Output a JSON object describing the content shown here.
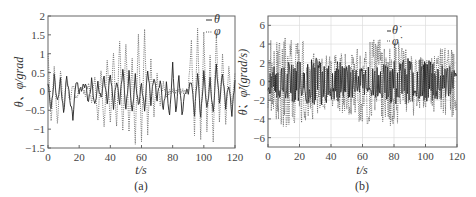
{
  "chart_data": [
    {
      "id": "a",
      "type": "line",
      "caption": "(a)",
      "xlabel": "t/s",
      "ylabel": "θ、φ/grad",
      "xlim": [
        0,
        120
      ],
      "ylim": [
        -1.5,
        2
      ],
      "xticks": [
        "0",
        "20",
        "40",
        "60",
        "80",
        "100",
        "120"
      ],
      "yticks": [
        "-1.5",
        "-1",
        "-0.5",
        "0",
        "0.5",
        "1",
        "1.5",
        "2"
      ],
      "grid": false,
      "legend": {
        "position": "upper right",
        "entries": [
          "θ",
          "φ"
        ]
      },
      "series": [
        {
          "name": "θ",
          "style": "solid",
          "amplitude_range": [
            -0.8,
            0.8
          ],
          "x": [
            0,
            2,
            4,
            6,
            8,
            10,
            12,
            14,
            16,
            18,
            20,
            22,
            24,
            26,
            28,
            30,
            32,
            34,
            36,
            38,
            40,
            42,
            44,
            46,
            48,
            50,
            52,
            54,
            56,
            58,
            60,
            62,
            64,
            66,
            68,
            70,
            72,
            74,
            76,
            78,
            80,
            82,
            84,
            86,
            88,
            90,
            92,
            94,
            96,
            98,
            100,
            102,
            104,
            106,
            108,
            110,
            112,
            114,
            116,
            118,
            120
          ],
          "y": [
            0.2,
            -0.5,
            0.4,
            -0.3,
            0.3,
            -0.6,
            0.4,
            -0.2,
            -0.7,
            0.3,
            0.0,
            0.1,
            0.2,
            -0.3,
            0.3,
            -0.4,
            0.2,
            -0.2,
            0.4,
            -0.3,
            0.5,
            -0.4,
            0.3,
            -0.3,
            0.6,
            -0.5,
            0.5,
            -0.6,
            0.4,
            -0.4,
            0.2,
            -0.5,
            0.6,
            -0.3,
            0.4,
            -0.2,
            0.3,
            -0.5,
            0.2,
            -0.7,
            0.7,
            -0.6,
            0.4,
            -0.6,
            0.0,
            0.0,
            0.3,
            -0.6,
            0.5,
            -0.7,
            0.5,
            -0.5,
            0.3,
            -0.6,
            0.7,
            -0.3,
            0.5,
            -0.4,
            0.2,
            -0.6,
            0.3
          ]
        },
        {
          "name": "φ",
          "style": "dotted",
          "amplitude_range": [
            -1.4,
            1.6
          ],
          "x": [
            0,
            2,
            4,
            6,
            8,
            10,
            12,
            14,
            16,
            18,
            20,
            22,
            24,
            26,
            28,
            30,
            32,
            34,
            36,
            38,
            40,
            42,
            44,
            46,
            48,
            50,
            52,
            54,
            56,
            58,
            60,
            62,
            64,
            66,
            68,
            70,
            72,
            74,
            76,
            78,
            80,
            82,
            84,
            86,
            88,
            90,
            92,
            94,
            96,
            98,
            100,
            102,
            104,
            106,
            108,
            110,
            112,
            114,
            116,
            118,
            120
          ],
          "y": [
            1.0,
            -0.8,
            0.7,
            -0.9,
            0.6,
            -0.5,
            0.4,
            -0.3,
            0.2,
            -0.2,
            0.0,
            0.1,
            -0.1,
            0.2,
            -0.3,
            0.4,
            -0.8,
            0.6,
            -1.0,
            0.9,
            -0.9,
            1.1,
            -1.0,
            1.4,
            -1.1,
            1.3,
            -1.1,
            0.9,
            -1.4,
            1.5,
            -1.3,
            1.6,
            -1.1,
            0.8,
            -0.6,
            0.4,
            -0.3,
            0.2,
            -0.1,
            0.0,
            0.0,
            0.0,
            0.0,
            0.0,
            0.0,
            0.0,
            1.3,
            -1.1,
            1.6,
            -1.2,
            1.5,
            -1.0,
            0.9,
            -1.3,
            1.5,
            -0.8,
            1.0,
            -0.9,
            0.7,
            -0.5,
            0.5
          ]
        }
      ]
    },
    {
      "id": "b",
      "type": "line",
      "caption": "(b)",
      "xlabel": "t/s",
      "ylabel": "θ̇、φ̇/(grad/s)",
      "xlim": [
        0,
        120
      ],
      "ylim": [
        -7,
        7
      ],
      "xticks": [
        "0",
        "20",
        "40",
        "60",
        "80",
        "100",
        "120"
      ],
      "yticks": [
        "-6",
        "-4",
        "-2",
        "0",
        "2",
        "4",
        "6"
      ],
      "grid": true,
      "legend": {
        "position": "upper right",
        "entries": [
          "θ̇",
          "φ̇"
        ]
      },
      "series": [
        {
          "name": "θ̇",
          "style": "solid",
          "amplitude_range": [
            -2.5,
            2.5
          ]
        },
        {
          "name": "φ̇",
          "style": "dotted",
          "amplitude_range": [
            -5,
            4.7
          ]
        }
      ]
    }
  ]
}
